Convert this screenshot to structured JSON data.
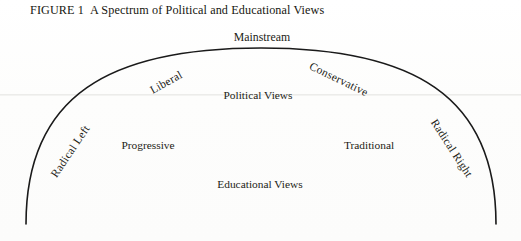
{
  "figure": {
    "number_label": "FIGURE 1",
    "title": "A Spectrum of Political and Educational Views"
  },
  "colors": {
    "arc_stroke": "#1a1a1a",
    "text": "#1c1c16",
    "background": "#fdfdfc",
    "scan_artifact_line": "#ececea"
  },
  "diagram": {
    "type": "arc-spectrum",
    "arc": {
      "left_endpoint": [
        26,
        224
      ],
      "right_endpoint": [
        496,
        224
      ],
      "apex": [
        261,
        48
      ],
      "stroke_width": 1.6
    },
    "arc_labels": [
      {
        "id": "radical-left",
        "text": "Radical Left",
        "x": 70,
        "y": 151,
        "rotation_deg": -56
      },
      {
        "id": "liberal",
        "text": "Liberal",
        "x": 166,
        "y": 82,
        "rotation_deg": -29
      },
      {
        "id": "mainstream",
        "text": "Mainstream",
        "x": 262,
        "y": 37,
        "rotation_deg": 0
      },
      {
        "id": "conservative",
        "text": "Conservative",
        "x": 339,
        "y": 79,
        "rotation_deg": 26
      },
      {
        "id": "radical-right",
        "text": "Radical Right",
        "x": 452,
        "y": 148,
        "rotation_deg": 57
      }
    ],
    "interior_labels": [
      {
        "id": "political-views",
        "text": "Political Views",
        "x": 258,
        "y": 95
      },
      {
        "id": "progressive",
        "text": "Progressive",
        "x": 148,
        "y": 145
      },
      {
        "id": "traditional",
        "text": "Traditional",
        "x": 369,
        "y": 145
      },
      {
        "id": "educational-views",
        "text": "Educational Views",
        "x": 260,
        "y": 184
      }
    ]
  }
}
